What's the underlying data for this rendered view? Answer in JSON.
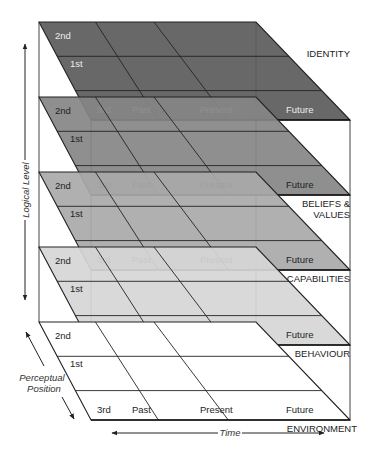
{
  "diagram": {
    "axes": {
      "vertical": "Logical Level",
      "depth": "Perceptual Position",
      "horizontal": "Time"
    },
    "position_labels": [
      "2nd",
      "1st",
      "3rd"
    ],
    "time_labels": [
      "Past",
      "Present",
      "Future"
    ],
    "levels": [
      {
        "name": "IDENTITY",
        "name_line2": "",
        "fill": "#5b5b5b",
        "text": "#ececec"
      },
      {
        "name": "BELIEFS &",
        "name_line2": "VALUES",
        "fill": "#868686",
        "text": "#1e1e1e"
      },
      {
        "name": "CAPABILITIES",
        "name_line2": "",
        "fill": "#a9a9a9",
        "text": "#1e1e1e"
      },
      {
        "name": "BEHAVIOUR",
        "name_line2": "",
        "fill": "#d6d6d6",
        "text": "#1e1e1e"
      },
      {
        "name": "ENVIRONMENT",
        "name_line2": "",
        "fill": "#ffffff",
        "text": "#1e1e1e"
      }
    ]
  }
}
